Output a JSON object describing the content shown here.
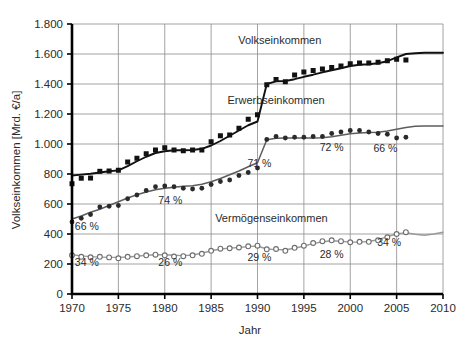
{
  "chart_data": {
    "type": "line",
    "title": "",
    "xlabel": "Jahr",
    "ylabel": "Volkseinkommen [Mrd. €/a]",
    "xlim": [
      1970,
      2010
    ],
    "ylim": [
      0,
      1800
    ],
    "grid": true,
    "legend_position": "inline-annotations",
    "xticks": [
      "1970",
      "1975",
      "1980",
      "1985",
      "1990",
      "1995",
      "2000",
      "2005",
      "2010"
    ],
    "xtick_values": [
      1970,
      1975,
      1980,
      1985,
      1990,
      1995,
      2000,
      2005,
      2010
    ],
    "yticks": [
      "0",
      "200",
      "400",
      "600",
      "800",
      "1.000",
      "1.200",
      "1.400",
      "1.600",
      "1.800"
    ],
    "ytick_values": [
      0,
      200,
      400,
      600,
      800,
      1000,
      1200,
      1400,
      1600,
      1800
    ],
    "series": [
      {
        "name": "Volkseinkommen",
        "marker": "filled-square",
        "color": "#111111",
        "x": [
          1970,
          1971,
          1972,
          1973,
          1974,
          1975,
          1976,
          1977,
          1978,
          1979,
          1980,
          1981,
          1982,
          1983,
          1984,
          1985,
          1986,
          1987,
          1988,
          1989,
          1990,
          1991,
          1992,
          1993,
          1994,
          1995,
          1996,
          1997,
          1998,
          1999,
          2000,
          2001,
          2002,
          2003,
          2004,
          2005,
          2006
        ],
        "values": [
          735,
          772,
          773,
          818,
          820,
          825,
          880,
          905,
          935,
          960,
          975,
          960,
          955,
          960,
          960,
          1015,
          1055,
          1060,
          1105,
          1165,
          1195,
          1395,
          1430,
          1415,
          1460,
          1480,
          1490,
          1500,
          1510,
          1520,
          1535,
          1540,
          1540,
          1545,
          1555,
          1565,
          1560
        ],
        "trend": [
          [
            1970,
            790
          ],
          [
            1971,
            796
          ],
          [
            1972,
            802
          ],
          [
            1973,
            810
          ],
          [
            1974,
            818
          ],
          [
            1975,
            824
          ],
          [
            1976,
            852
          ],
          [
            1977,
            885
          ],
          [
            1978,
            915
          ],
          [
            1979,
            940
          ],
          [
            1980,
            952
          ],
          [
            1981,
            958
          ],
          [
            1982,
            958
          ],
          [
            1983,
            960
          ],
          [
            1984,
            968
          ],
          [
            1985,
            990
          ],
          [
            1986,
            1020
          ],
          [
            1987,
            1055
          ],
          [
            1988,
            1090
          ],
          [
            1989,
            1125
          ],
          [
            1990,
            1150
          ],
          [
            1991,
            1400
          ],
          [
            1992,
            1418
          ],
          [
            1993,
            1420
          ],
          [
            1994,
            1432
          ],
          [
            1995,
            1448
          ],
          [
            1996,
            1462
          ],
          [
            1997,
            1478
          ],
          [
            1998,
            1492
          ],
          [
            1999,
            1505
          ],
          [
            2000,
            1520
          ],
          [
            2001,
            1528
          ],
          [
            2002,
            1532
          ],
          [
            2003,
            1538
          ],
          [
            2004,
            1552
          ],
          [
            2005,
            1578
          ],
          [
            2006,
            1600
          ],
          [
            2007,
            1605
          ],
          [
            2008,
            1608
          ],
          [
            2009,
            1608
          ],
          [
            2010,
            1608
          ]
        ]
      },
      {
        "name": "Erwerbseinkommen",
        "marker": "filled-circle",
        "color": "#2a2a2a",
        "x": [
          1970,
          1971,
          1972,
          1973,
          1974,
          1975,
          1976,
          1977,
          1978,
          1979,
          1980,
          1981,
          1982,
          1983,
          1984,
          1985,
          1986,
          1987,
          1988,
          1989,
          1990,
          1991,
          1992,
          1993,
          1994,
          1995,
          1996,
          1997,
          1998,
          1999,
          2000,
          2001,
          2002,
          2003,
          2004,
          2005,
          2006
        ],
        "values": [
          480,
          505,
          530,
          580,
          585,
          590,
          635,
          660,
          690,
          715,
          720,
          715,
          705,
          700,
          705,
          730,
          750,
          760,
          790,
          810,
          840,
          1030,
          1050,
          1040,
          1045,
          1045,
          1050,
          1050,
          1070,
          1080,
          1090,
          1090,
          1080,
          1070,
          1065,
          1040,
          1045
        ],
        "trend": [
          [
            1970,
            500
          ],
          [
            1971,
            520
          ],
          [
            1972,
            545
          ],
          [
            1973,
            565
          ],
          [
            1974,
            590
          ],
          [
            1975,
            615
          ],
          [
            1976,
            640
          ],
          [
            1977,
            662
          ],
          [
            1978,
            680
          ],
          [
            1979,
            695
          ],
          [
            1980,
            705
          ],
          [
            1981,
            712
          ],
          [
            1982,
            718
          ],
          [
            1983,
            722
          ],
          [
            1984,
            732
          ],
          [
            1985,
            748
          ],
          [
            1986,
            770
          ],
          [
            1987,
            795
          ],
          [
            1988,
            820
          ],
          [
            1989,
            848
          ],
          [
            1990,
            875
          ],
          [
            1991,
            1028
          ],
          [
            1992,
            1038
          ],
          [
            1993,
            1040
          ],
          [
            1994,
            1040
          ],
          [
            1995,
            1040
          ],
          [
            1996,
            1040
          ],
          [
            1997,
            1042
          ],
          [
            1998,
            1048
          ],
          [
            1999,
            1058
          ],
          [
            2000,
            1068
          ],
          [
            2001,
            1074
          ],
          [
            2002,
            1076
          ],
          [
            2003,
            1078
          ],
          [
            2004,
            1086
          ],
          [
            2005,
            1098
          ],
          [
            2006,
            1110
          ],
          [
            2007,
            1118
          ],
          [
            2008,
            1120
          ],
          [
            2009,
            1120
          ],
          [
            2010,
            1120
          ]
        ]
      },
      {
        "name": "Vermögenseinkommen",
        "marker": "open-circle",
        "color": "#9a9a9a",
        "x": [
          1970,
          1971,
          1972,
          1973,
          1974,
          1975,
          1976,
          1977,
          1978,
          1979,
          1980,
          1981,
          1982,
          1983,
          1984,
          1985,
          1986,
          1987,
          1988,
          1989,
          1990,
          1991,
          1992,
          1993,
          1994,
          1995,
          1996,
          1997,
          1998,
          1999,
          2000,
          2001,
          2002,
          2003,
          2004,
          2005,
          2006
        ],
        "values": [
          258,
          248,
          245,
          248,
          244,
          238,
          248,
          252,
          258,
          262,
          258,
          250,
          252,
          258,
          268,
          288,
          302,
          305,
          310,
          318,
          322,
          298,
          300,
          288,
          308,
          322,
          340,
          352,
          358,
          352,
          345,
          348,
          348,
          358,
          378,
          400,
          412
        ],
        "trend": [
          [
            1970,
            262
          ],
          [
            1971,
            254
          ],
          [
            1972,
            249
          ],
          [
            1973,
            246
          ],
          [
            1974,
            244
          ],
          [
            1975,
            244
          ],
          [
            1976,
            247
          ],
          [
            1977,
            252
          ],
          [
            1978,
            258
          ],
          [
            1979,
            262
          ],
          [
            1980,
            262
          ],
          [
            1981,
            258
          ],
          [
            1982,
            256
          ],
          [
            1983,
            260
          ],
          [
            1984,
            272
          ],
          [
            1985,
            288
          ],
          [
            1986,
            300
          ],
          [
            1987,
            306
          ],
          [
            1988,
            310
          ],
          [
            1989,
            316
          ],
          [
            1990,
            320
          ],
          [
            1991,
            300
          ],
          [
            1992,
            296
          ],
          [
            1993,
            295
          ],
          [
            1994,
            305
          ],
          [
            1995,
            320
          ],
          [
            1996,
            336
          ],
          [
            1997,
            348
          ],
          [
            1998,
            355
          ],
          [
            1999,
            352
          ],
          [
            2000,
            346
          ],
          [
            2001,
            346
          ],
          [
            2002,
            350
          ],
          [
            2003,
            362
          ],
          [
            2004,
            382
          ],
          [
            2005,
            400
          ],
          [
            2006,
            408
          ],
          [
            2007,
            398
          ],
          [
            2008,
            392
          ],
          [
            2009,
            400
          ],
          [
            2010,
            412
          ]
        ]
      }
    ],
    "annotations": [
      {
        "text": "Volkseinkommen",
        "x": 1992.4,
        "y": 1665,
        "kind": "series-name"
      },
      {
        "text": "Erwerbseinkommen",
        "x": 1992.0,
        "y": 1270,
        "kind": "series-name"
      },
      {
        "text": "Vermögenseinkommen",
        "x": 1991.5,
        "y": 480,
        "kind": "series-name"
      },
      {
        "text": "66 %",
        "x": 1971.6,
        "y": 430,
        "kind": "share"
      },
      {
        "text": "34 %",
        "x": 1971.6,
        "y": 185,
        "kind": "share"
      },
      {
        "text": "74 %",
        "x": 1980.6,
        "y": 600,
        "kind": "share"
      },
      {
        "text": "26 %",
        "x": 1980.6,
        "y": 185,
        "kind": "share"
      },
      {
        "text": "71 %",
        "x": 1990.2,
        "y": 845,
        "kind": "share"
      },
      {
        "text": "29 %",
        "x": 1990.2,
        "y": 222,
        "kind": "share"
      },
      {
        "text": "72 %",
        "x": 1998.0,
        "y": 955,
        "kind": "share"
      },
      {
        "text": "28 %",
        "x": 1998.0,
        "y": 240,
        "kind": "share"
      },
      {
        "text": "66 %",
        "x": 2003.8,
        "y": 945,
        "kind": "share"
      },
      {
        "text": "34 %",
        "x": 2004.2,
        "y": 318,
        "kind": "share"
      }
    ]
  }
}
